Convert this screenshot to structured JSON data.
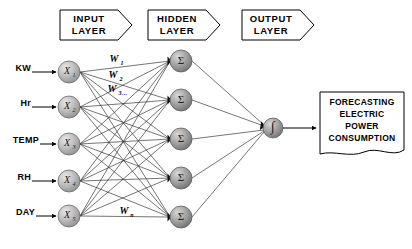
{
  "diagram": {
    "background_color": "#ffffff",
    "line_color": "#2b2b2b",
    "node_fill": "#b8b8b8",
    "node_stroke": "#555555"
  },
  "banners": [
    {
      "id": "input",
      "line1": "INPUT",
      "line2": "LAYER",
      "x": 60,
      "y": 10,
      "w": 72,
      "h": 30
    },
    {
      "id": "hidden",
      "line1": "HIDDEN",
      "line2": "LAYER",
      "x": 148,
      "y": 10,
      "w": 72,
      "h": 30
    },
    {
      "id": "output",
      "line1": "OUTPUT",
      "line2": "LAYER",
      "x": 242,
      "y": 10,
      "w": 72,
      "h": 30
    }
  ],
  "input_layer": {
    "neurons": [
      {
        "id": "x1",
        "symbol": "X",
        "subscript": "1",
        "source_label": "KW",
        "cx": 69,
        "cy": 72
      },
      {
        "id": "x2",
        "symbol": "X",
        "subscript": "2",
        "source_label": "Hr",
        "cx": 69,
        "cy": 107
      },
      {
        "id": "x3",
        "symbol": "X",
        "subscript": "3",
        "source_label": "TEMP",
        "cx": 69,
        "cy": 144
      },
      {
        "id": "x4",
        "symbol": "X",
        "subscript": "4",
        "source_label": "RH",
        "cx": 69,
        "cy": 181
      },
      {
        "id": "x5",
        "symbol": "X",
        "subscript": "5",
        "source_label": "DAY",
        "cx": 69,
        "cy": 216
      }
    ],
    "radius": 11
  },
  "hidden_layer": {
    "neurons": [
      {
        "id": "h1",
        "symbol": "Σ",
        "cx": 181,
        "cy": 61
      },
      {
        "id": "h2",
        "symbol": "Σ",
        "cx": 181,
        "cy": 100
      },
      {
        "id": "h3",
        "symbol": "Σ",
        "cx": 181,
        "cy": 139
      },
      {
        "id": "h4",
        "symbol": "Σ",
        "cx": 181,
        "cy": 178
      },
      {
        "id": "h5",
        "symbol": "Σ",
        "cx": 181,
        "cy": 217
      }
    ],
    "radius": 11
  },
  "output_layer": {
    "neurons": [
      {
        "id": "o1",
        "symbol": "∫",
        "cx": 273,
        "cy": 128
      }
    ],
    "radius": 10
  },
  "weights": [
    {
      "id": "w1",
      "symbol": "W",
      "subscript": "1",
      "x": 114,
      "y": 60
    },
    {
      "id": "w2",
      "symbol": "W",
      "subscript": "2",
      "x": 113,
      "y": 76
    },
    {
      "id": "w3",
      "symbol": "W",
      "subscript": "3…",
      "x": 112,
      "y": 90
    },
    {
      "id": "wn",
      "symbol": "W",
      "subscript": "n",
      "x": 124,
      "y": 212
    }
  ],
  "output_box": {
    "lines": [
      "FORECASTING",
      "ELECTRIC",
      "POWER",
      "CONSUMPTION"
    ],
    "x": 320,
    "y": 92,
    "w": 84,
    "h": 64
  }
}
